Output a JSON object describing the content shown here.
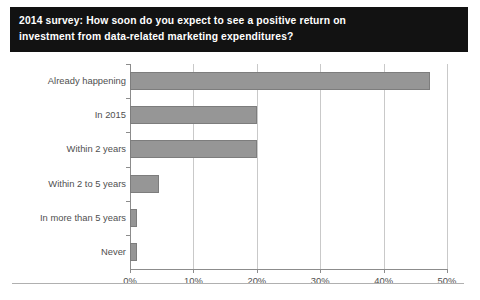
{
  "title": {
    "line1": "2014 survey: How soon do you expect to see a positive return on",
    "line2": "investment from data-related marketing expenditures?",
    "background_color": "#121212",
    "text_color": "#ffffff"
  },
  "chart_data": {
    "type": "bar",
    "orientation": "horizontal",
    "title": "2014 survey: How soon do you expect to see a positive return on investment from data-related marketing expenditures?",
    "categories": [
      "Already happening",
      "In 2015",
      "Within 2 years",
      "Within 2 to 5 years",
      "In more than 5 years",
      "Never"
    ],
    "values": [
      47.3,
      20.0,
      20.0,
      4.6,
      1.1,
      1.1
    ],
    "xlabel": "",
    "ylabel": "",
    "xlim": [
      0,
      50
    ],
    "xticks": [
      0,
      10,
      20,
      30,
      40,
      50
    ],
    "xtick_labels": [
      "0%",
      "10%",
      "20%",
      "30%",
      "40%",
      "50%"
    ],
    "grid": "vertical",
    "legend": "none",
    "bar_color": "#969696",
    "bar_border_color": "#7d7d7d",
    "gridline_color": "#c9c9c9",
    "axis_color": "#8c8c8c"
  }
}
